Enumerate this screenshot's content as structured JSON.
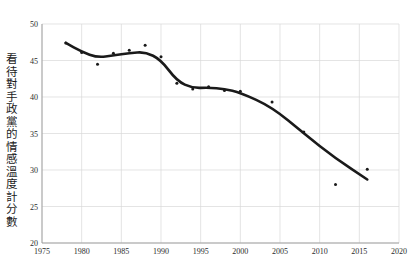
{
  "chart_data": {
    "type": "scatter",
    "title": "",
    "xlabel": "",
    "ylabel": "看待對手政黨的情感溫度計分數",
    "xlim": [
      1975,
      2020
    ],
    "ylim": [
      20,
      50
    ],
    "grid": true,
    "legend": "none",
    "xticks": [
      1975,
      1980,
      1985,
      1990,
      1995,
      2000,
      2005,
      2010,
      2015,
      2020
    ],
    "yticks": [
      20,
      25,
      30,
      35,
      40,
      45,
      50
    ],
    "series": [
      {
        "name": "points",
        "marker": "dot",
        "color": "#1a1a1a",
        "x": [
          1978,
          1980,
          1982,
          1984,
          1986,
          1988,
          1990,
          1992,
          1994,
          1996,
          1998,
          2000,
          2004,
          2008,
          2012,
          2016
        ],
        "y": [
          47.4,
          46.1,
          44.5,
          46.0,
          46.4,
          47.1,
          45.5,
          41.9,
          41.1,
          41.4,
          40.9,
          40.8,
          39.3,
          35.2,
          28.0,
          30.1
        ]
      },
      {
        "name": "trend",
        "marker": "line",
        "color": "#1a1a1a",
        "x": [
          1978,
          1980,
          1982,
          1984,
          1986,
          1988,
          1990,
          1992,
          1994,
          1996,
          1998,
          2000,
          2004,
          2008,
          2012,
          2016
        ],
        "y": [
          47.4,
          46.2,
          45.4,
          45.7,
          46.0,
          46.2,
          45.1,
          42.2,
          41.2,
          41.3,
          41.1,
          40.6,
          38.6,
          35.0,
          31.6,
          28.7
        ]
      }
    ]
  },
  "axis": {
    "x_tick_labels": [
      "1975",
      "1980",
      "1985",
      "1990",
      "1995",
      "2000",
      "2005",
      "2010",
      "2015",
      "2020"
    ],
    "y_tick_labels": [
      "20",
      "25",
      "30",
      "35",
      "40",
      "45",
      "50"
    ]
  }
}
